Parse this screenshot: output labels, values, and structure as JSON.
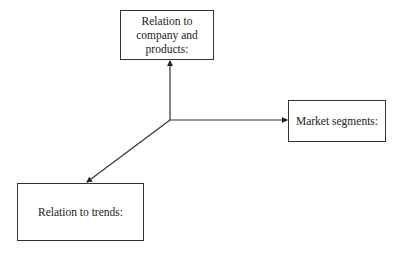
{
  "diagram": {
    "type": "radial-arrows",
    "center": {
      "x": 170,
      "y": 120
    },
    "nodes": [
      {
        "id": "top",
        "lines": [
          "Relation to",
          "company and",
          "products:"
        ]
      },
      {
        "id": "right",
        "lines": [
          "Market segments:"
        ]
      },
      {
        "id": "bottom",
        "lines": [
          "Relation to trends:"
        ]
      }
    ],
    "edges": [
      {
        "from": "center",
        "to": "top"
      },
      {
        "from": "center",
        "to": "right"
      },
      {
        "from": "center",
        "to": "bottom"
      }
    ],
    "line_color": "#333333"
  }
}
